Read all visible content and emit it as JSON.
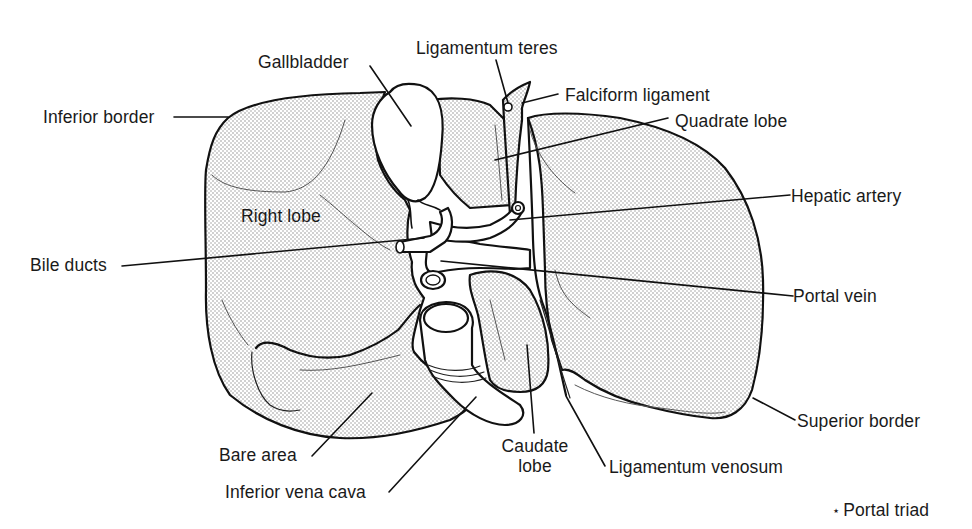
{
  "figure": {
    "colors": {
      "outline": "#111111",
      "stipple": "#8a8a8a",
      "background": "#ffffff",
      "text": "#1a1a1a"
    }
  },
  "labels": {
    "inferior_border": "Inferior border",
    "gallbladder": "Gallbladder",
    "ligamentum_teres": "Ligamentum teres",
    "falciform_ligament": "Falciform ligament",
    "quadrate_lobe": "Quadrate lobe",
    "hepatic_artery": "Hepatic artery",
    "right_lobe": "Right lobe",
    "bile_ducts": "Bile ducts",
    "portal_vein": "Portal vein",
    "superior_border": "Superior border",
    "bare_area": "Bare area",
    "inferior_vena_cava": "Inferior vena cava",
    "caudate_lobe_line1": "Caudate",
    "caudate_lobe_line2": "lobe",
    "ligamentum_venosum": "Ligamentum venosum"
  },
  "legend": {
    "symbol": "•",
    "star": "⋆",
    "text": "Portal triad"
  }
}
